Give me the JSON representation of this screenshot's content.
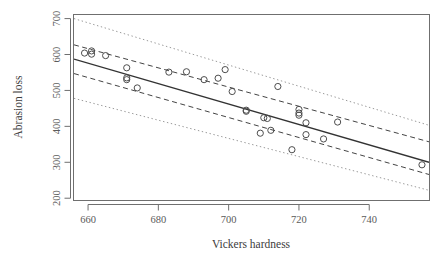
{
  "chart_data": {
    "type": "scatter",
    "title": "",
    "xlabel": "Vickers hardness",
    "ylabel": "Abrasion loss",
    "xlim": [
      656,
      757
    ],
    "ylim": [
      195,
      710
    ],
    "xticks": [
      660,
      680,
      700,
      720,
      740
    ],
    "yticks": [
      200,
      300,
      400,
      500,
      600,
      700
    ],
    "grid": false,
    "legend": null,
    "point_marker": "open-circle",
    "point_color": "#4d4d4d",
    "x": [
      659,
      661,
      661,
      665,
      671,
      671,
      671,
      674,
      683,
      688,
      693,
      697,
      699,
      701,
      705,
      705,
      709,
      710,
      711,
      712,
      714,
      718,
      720,
      720,
      720,
      722,
      722,
      727,
      731,
      755
    ],
    "y": [
      604,
      610,
      601,
      597,
      563,
      535,
      530,
      507,
      551,
      552,
      530,
      534,
      558,
      497,
      445,
      442,
      381,
      424,
      422,
      389,
      511,
      335,
      447,
      437,
      431,
      410,
      377,
      365,
      412,
      293
    ],
    "series": [
      {
        "name": "fitted regression line",
        "type": "line",
        "style": "solid",
        "color": "#333333",
        "x": [
          656,
          757
        ],
        "y": [
          587,
          300
        ]
      },
      {
        "name": "confidence band upper",
        "type": "line",
        "style": "dashed",
        "color": "#444444",
        "x": [
          656,
          757
        ],
        "y": [
          627,
          357
        ]
      },
      {
        "name": "confidence band lower",
        "type": "line",
        "style": "dashed",
        "color": "#444444",
        "x": [
          656,
          757
        ],
        "y": [
          547,
          266
        ]
      },
      {
        "name": "prediction band upper",
        "type": "line",
        "style": "dotted",
        "color": "#9a9a9a",
        "x": [
          656,
          757
        ],
        "y": [
          700,
          403
        ]
      },
      {
        "name": "prediction band lower",
        "type": "line",
        "style": "dotted",
        "color": "#9a9a9a",
        "x": [
          656,
          757
        ],
        "y": [
          478,
          222
        ]
      }
    ]
  },
  "axes": {
    "x_tick_labels": [
      "660",
      "680",
      "700",
      "720",
      "740"
    ],
    "y_tick_labels": [
      "200",
      "300",
      "400",
      "500",
      "600",
      "700"
    ],
    "x_axis_title": "Vickers hardness",
    "y_axis_title": "Abrasion loss"
  },
  "style": {
    "frame_color": "#6f6f6f",
    "axis_color": "#6f6f6f",
    "background": "#ffffff"
  }
}
